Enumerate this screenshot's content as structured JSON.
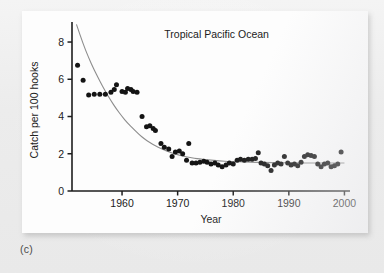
{
  "figure": {
    "caption": "(c)",
    "panel_bg": "#fdfdfd",
    "page_bg": "#ececec"
  },
  "chart_data": {
    "type": "scatter",
    "title": "Tropical Pacific Ocean",
    "xlabel": "Year",
    "ylabel": "Catch per 100  hooks",
    "xlim": [
      1951,
      2001
    ],
    "ylim": [
      0,
      8.7
    ],
    "xticks": [
      1960,
      1970,
      1980,
      1990,
      2000
    ],
    "xtick_labels": [
      "1960",
      "1970",
      "1980",
      "1990",
      "2000"
    ],
    "yticks": [
      0,
      2,
      4,
      6,
      8
    ],
    "ytick_labels": [
      "0",
      "2",
      "4",
      "6",
      "8"
    ],
    "grid": false,
    "legend": "none",
    "marker_color": "#141414",
    "marker_shape": "circle",
    "marker_size_px": 4.6,
    "curve_color": "#8d8d8d",
    "curve_label": "fitted exponential decline",
    "series": [
      {
        "name": "Catch per 100 hooks",
        "points": [
          [
            1952,
            6.75
          ],
          [
            1953,
            5.95
          ],
          [
            1954,
            5.15
          ],
          [
            1955,
            5.2
          ],
          [
            1956,
            5.2
          ],
          [
            1957,
            5.2
          ],
          [
            1958,
            5.3
          ],
          [
            1958.6,
            5.45
          ],
          [
            1959,
            5.7
          ],
          [
            1960,
            5.35
          ],
          [
            1960.6,
            5.3
          ],
          [
            1961,
            5.5
          ],
          [
            1961.6,
            5.45
          ],
          [
            1962,
            5.35
          ],
          [
            1962.7,
            5.3
          ],
          [
            1963.6,
            4.0
          ],
          [
            1964.4,
            3.45
          ],
          [
            1965,
            3.5
          ],
          [
            1965.6,
            3.35
          ],
          [
            1966,
            3.25
          ],
          [
            1967,
            2.55
          ],
          [
            1967.6,
            2.35
          ],
          [
            1968.4,
            2.25
          ],
          [
            1969,
            1.85
          ],
          [
            1969.6,
            2.1
          ],
          [
            1970.3,
            2.15
          ],
          [
            1970.9,
            2.0
          ],
          [
            1971.6,
            1.65
          ],
          [
            1972,
            2.55
          ],
          [
            1972.6,
            1.5
          ],
          [
            1973.3,
            1.5
          ],
          [
            1974,
            1.55
          ],
          [
            1974.7,
            1.6
          ],
          [
            1975.3,
            1.55
          ],
          [
            1976,
            1.45
          ],
          [
            1976.7,
            1.5
          ],
          [
            1977.3,
            1.4
          ],
          [
            1978,
            1.3
          ],
          [
            1978.7,
            1.4
          ],
          [
            1979.3,
            1.5
          ],
          [
            1980,
            1.45
          ],
          [
            1980.7,
            1.65
          ],
          [
            1981.3,
            1.7
          ],
          [
            1982,
            1.65
          ],
          [
            1982.7,
            1.7
          ],
          [
            1983.4,
            1.7
          ],
          [
            1984,
            1.75
          ],
          [
            1984.5,
            2.05
          ],
          [
            1985,
            1.5
          ],
          [
            1985.6,
            1.45
          ],
          [
            1986.2,
            1.35
          ],
          [
            1986.8,
            1.1
          ],
          [
            1987.4,
            1.4
          ],
          [
            1988,
            1.5
          ],
          [
            1988.6,
            1.45
          ],
          [
            1989.2,
            1.85
          ],
          [
            1989.8,
            1.5
          ],
          [
            1990.4,
            1.4
          ],
          [
            1991,
            1.45
          ],
          [
            1991.6,
            1.35
          ],
          [
            1992.2,
            1.55
          ],
          [
            1992.8,
            1.85
          ],
          [
            1993.4,
            1.95
          ],
          [
            1994,
            1.9
          ],
          [
            1994.6,
            1.85
          ],
          [
            1995.2,
            1.45
          ],
          [
            1995.8,
            1.3
          ],
          [
            1996.4,
            1.45
          ],
          [
            1997,
            1.5
          ],
          [
            1997.6,
            1.3
          ],
          [
            1998.2,
            1.35
          ],
          [
            1998.8,
            1.45
          ],
          [
            1999.4,
            2.1
          ]
        ]
      }
    ],
    "fit_curve": {
      "description": "smooth exponential decay from ~9 in 1952 to ~1.5 plateau",
      "x": [
        1951.8,
        1953,
        1954,
        1955,
        1956,
        1957,
        1958,
        1959,
        1960,
        1961,
        1962,
        1963,
        1964,
        1965,
        1966,
        1967,
        1968,
        1969,
        1970,
        1971,
        1972,
        1973,
        1974,
        1975,
        1976,
        1977,
        1978,
        1979,
        1980,
        1982,
        1984,
        1986,
        1988,
        1990,
        1992,
        1994,
        1996,
        1998,
        2000
      ],
      "y": [
        8.95,
        7.9,
        7.15,
        6.5,
        5.9,
        5.35,
        4.85,
        4.4,
        4.0,
        3.65,
        3.35,
        3.05,
        2.8,
        2.6,
        2.42,
        2.28,
        2.15,
        2.04,
        1.95,
        1.87,
        1.81,
        1.76,
        1.72,
        1.69,
        1.66,
        1.63,
        1.61,
        1.59,
        1.58,
        1.56,
        1.54,
        1.53,
        1.52,
        1.51,
        1.51,
        1.5,
        1.5,
        1.5,
        1.5
      ]
    }
  }
}
